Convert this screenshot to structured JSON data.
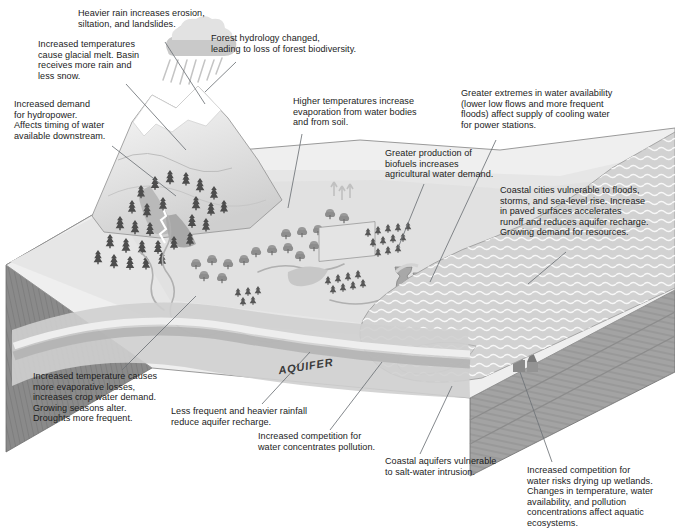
{
  "figure": {
    "kind": "conceptual-diagram",
    "clipped_title": "",
    "terrain_label": "AQUIFER"
  },
  "captions": {
    "rain": "Heavier rain increases erosion,\nsiltation, and landslides.",
    "glacier": "Increased temperatures\ncause glacial melt. Basin\nreceives more rain and\nless snow.",
    "forest": "Forest hydrology changed,\nleading to loss of forest biodiversity.",
    "hydropower": "Increased demand\nfor hydropower.\nAffects timing of water\navailable downstream.",
    "evaporation": "Higher temperatures increase\nevaporation from water bodies\nand from soil.",
    "power_stations": "Greater extremes in water availability\n(lower low flows and more frequent\nfloods) affect supply of cooling water\nfor power stations.",
    "biofuels": "Greater production of\nbiofuels increases\nagricultural water demand.",
    "coastal_cities": "Coastal cities vulnerable to floods,\nstorms, and sea-level rise. Increase\nin paved surfaces accelerates\nrunoff and reduces aquifer recharge.\nGrowing demand for resources.",
    "crops": "Increased temperature causes\nmore evaporative losses,\nincreases crop water demand.\nGrowing seasons alter.\nDroughts more frequent.",
    "recharge": "Less frequent and heavier rainfall\nreduce aquifer recharge.",
    "pollution": "Increased competition for\nwater concentrates pollution.",
    "salt_intrusion": "Coastal aquifers vulnerable\nto salt-water intrusion.",
    "wetlands": "Increased competition for\nwater risks drying up wetlands.\nChanges in temperature, water\navailability, and pollution\nconcentrations affect aquatic\necosystems."
  },
  "scene_elements": {
    "cloud": "rain-cloud-icon",
    "glacier": "snow-capped-mountain",
    "conifers": "coniferous-forest",
    "deciduous": "deciduous-woodland",
    "plantation": "biofuel-plantation",
    "reservoir": "mountain-reservoir",
    "river": "river-network",
    "cooling_towers": "power-station-cooling-towers",
    "city": "coastal-city-skyline",
    "wetland": "coastal-wetland",
    "sea": "sea-with-wave-hatching",
    "block": "3d-geology-block"
  },
  "colors": {
    "background": "#ffffff",
    "text": "#1b1b1b",
    "leader_line": "#6e7277",
    "land_light": "#f0f0f0",
    "land_mid": "#d9d9d9",
    "land_shade": "#c2c2c2",
    "block_side": "#8a8a8a",
    "block_front": "#a3a3a3",
    "aquifer_band": "#b5b5b5",
    "sea": "#d2d2d2",
    "snow": "#ffffff",
    "tree_dark": "#4d4d4d",
    "city_dark": "#555555"
  }
}
